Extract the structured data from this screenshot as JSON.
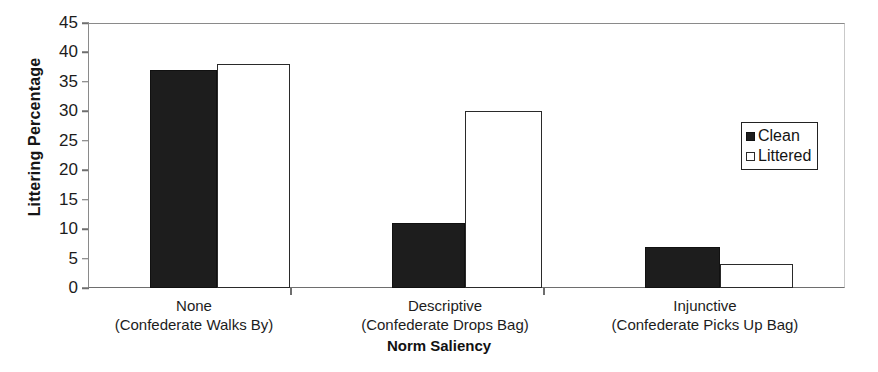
{
  "chart_data": {
    "type": "bar",
    "title": "",
    "subtitle": "",
    "xlabel": "Norm Saliency",
    "ylabel": "Littering Percentage",
    "ylim": [
      0,
      45
    ],
    "yticks": [
      0,
      5,
      10,
      15,
      20,
      25,
      30,
      35,
      40,
      45
    ],
    "grid": false,
    "legend_position": "right-inside",
    "categories": [
      "None\n(Confederate Walks By)",
      "Descriptive\n(Confederate Drops Bag)",
      "Injunctive\n(Confederate Picks Up Bag)"
    ],
    "category_lines": [
      {
        "line1": "None",
        "line2": "(Confederate Walks By)"
      },
      {
        "line1": "Descriptive",
        "line2": "(Confederate Drops Bag)"
      },
      {
        "line1": "Injunctive",
        "line2": "(Confederate Picks Up Bag)"
      }
    ],
    "series": [
      {
        "name": "Clean",
        "values": [
          37,
          11,
          7
        ],
        "color": "#1d1d1d",
        "fill": "solid"
      },
      {
        "name": "Littered",
        "values": [
          38,
          30,
          4
        ],
        "color": "#ffffff",
        "fill": "open"
      }
    ]
  },
  "axes": {
    "y_title": "Littering Percentage",
    "x_title": "Norm Saliency",
    "y_tick_labels": [
      "45",
      "40",
      "35",
      "30",
      "25",
      "20",
      "15",
      "10",
      "5",
      "0"
    ]
  },
  "legend": {
    "entries": [
      {
        "label": "Clean",
        "swatch": "filled-square"
      },
      {
        "label": "Littered",
        "swatch": "open-square"
      }
    ]
  }
}
